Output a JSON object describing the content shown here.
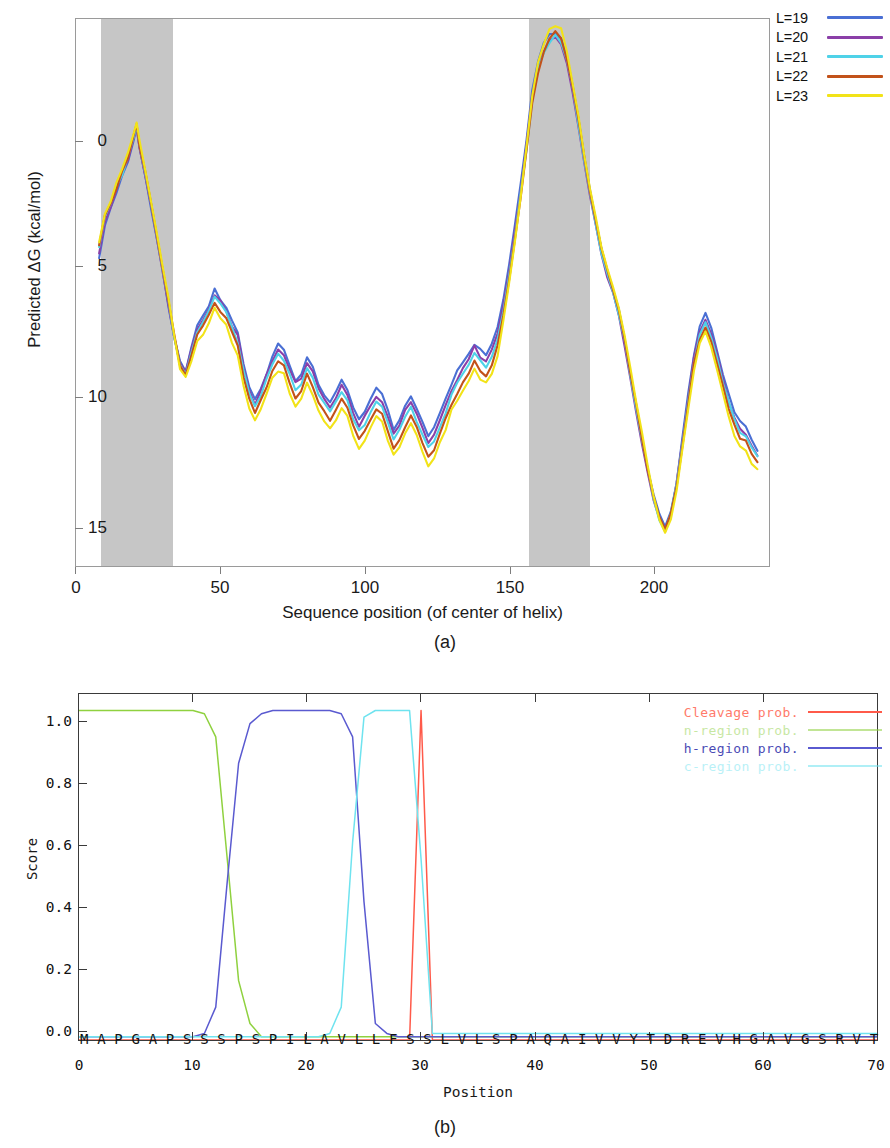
{
  "panel_a": {
    "caption": "(a)",
    "xlabel": "Sequence position (of center of helix)",
    "ylabel": "Predicted ΔG (kcal/mol)",
    "xticks": [
      "0",
      "50",
      "100",
      "150",
      "200"
    ],
    "yticks": [
      "0",
      "5",
      "10",
      "15"
    ],
    "legend": [
      {
        "label": "L=19",
        "color": "#4a6fd4"
      },
      {
        "label": "L=20",
        "color": "#8b3fa8"
      },
      {
        "label": "L=21",
        "color": "#4fd2e8"
      },
      {
        "label": "L=22",
        "color": "#c2521a"
      },
      {
        "label": "L=23",
        "color": "#f2e318"
      }
    ],
    "shaded_regions": [
      {
        "start": 9,
        "end": 34,
        "color": "#c3c3c3"
      },
      {
        "start": 157,
        "end": 178,
        "color": "#c3c3c3"
      }
    ]
  },
  "panel_b": {
    "caption": "(b)",
    "xlabel": "Position",
    "ylabel": "Score",
    "xticks": [
      "0",
      "10",
      "20",
      "30",
      "40",
      "50",
      "60",
      "70"
    ],
    "yticks": [
      "0.0",
      "0.2",
      "0.4",
      "0.6",
      "0.8",
      "1.0"
    ],
    "sequence": "M A P G A P S S S P S P I L A V L L F S S L V L S P A Q A I V V Y T D R E V H G A V G S R V T L H C S F W S S E W V S D D I S F T W R Y Q P",
    "legend": [
      {
        "label": "Cleavage prob.",
        "color": "#ff5a4a"
      },
      {
        "label": "n-region prob.",
        "color": "#8fd13f"
      },
      {
        "label": "h-region prob.",
        "color": "#5a5ad0"
      },
      {
        "label": "c-region prob.",
        "color": "#6fe3ef"
      }
    ]
  },
  "chart_data": [
    {
      "type": "line",
      "panel": "(a)",
      "title": "",
      "xlabel": "Sequence position (of center of helix)",
      "ylabel": "Predicted ΔG (kcal/mol)",
      "xlim": [
        0,
        240
      ],
      "ylim": [
        -3.0,
        16.5
      ],
      "y_axis_inverted": true,
      "grid": false,
      "legend_position": "top-right-outside",
      "shaded_regions": [
        [
          9,
          34
        ],
        [
          157,
          178
        ]
      ],
      "x": [
        8,
        10,
        12,
        14,
        16,
        18,
        20,
        21,
        22,
        24,
        26,
        28,
        30,
        32,
        34,
        36,
        38,
        40,
        42,
        44,
        46,
        48,
        50,
        52,
        54,
        56,
        58,
        60,
        62,
        64,
        66,
        68,
        70,
        72,
        74,
        76,
        78,
        80,
        82,
        84,
        86,
        88,
        90,
        92,
        94,
        96,
        98,
        100,
        102,
        104,
        106,
        108,
        110,
        112,
        114,
        116,
        118,
        120,
        122,
        124,
        126,
        128,
        130,
        132,
        134,
        136,
        138,
        140,
        142,
        144,
        146,
        148,
        150,
        152,
        154,
        156,
        158,
        160,
        162,
        164,
        166,
        168,
        170,
        172,
        174,
        176,
        178,
        180,
        182,
        184,
        186,
        188,
        190,
        192,
        194,
        196,
        198,
        200,
        202,
        204,
        206,
        208,
        210,
        212,
        214,
        216,
        218,
        220,
        222,
        224,
        226,
        228,
        230,
        232,
        234,
        236,
        237
      ],
      "series": [
        {
          "name": "L=19",
          "color": "#4a6fd4",
          "values": [
            5.6,
            4.3,
            3.8,
            3.2,
            2.6,
            2.1,
            1.3,
            0.9,
            1.6,
            2.6,
            3.7,
            4.8,
            6.0,
            7.2,
            8.3,
            9.2,
            9.5,
            8.7,
            7.9,
            7.6,
            7.2,
            6.6,
            7.0,
            7.3,
            7.8,
            8.2,
            9.3,
            10.2,
            10.6,
            10.2,
            9.6,
            9.0,
            8.6,
            8.8,
            9.4,
            9.9,
            9.6,
            9.0,
            9.4,
            10.0,
            10.4,
            10.6,
            10.3,
            9.9,
            10.2,
            10.8,
            11.3,
            11.0,
            10.6,
            10.2,
            10.4,
            11.0,
            11.6,
            11.3,
            10.8,
            10.4,
            10.9,
            11.4,
            11.9,
            11.6,
            11.1,
            10.6,
            10.0,
            9.6,
            9.3,
            9.0,
            8.6,
            8.8,
            9.0,
            8.6,
            8.0,
            7.0,
            5.8,
            4.4,
            2.9,
            1.3,
            -0.4,
            -1.5,
            -2.1,
            -2.4,
            -2.5,
            -2.3,
            -1.6,
            -0.6,
            0.6,
            1.9,
            3.1,
            4.2,
            5.2,
            6.0,
            6.6,
            7.4,
            8.4,
            9.6,
            10.8,
            11.9,
            13.0,
            14.0,
            14.7,
            15.1,
            14.6,
            13.5,
            12.0,
            10.4,
            9.0,
            7.9,
            7.5,
            8.0,
            8.8,
            9.6,
            10.4,
            11.0,
            11.4,
            11.6,
            12.0,
            12.4
          ]
        },
        {
          "name": "L=20",
          "color": "#8b3fa8",
          "values": [
            5.4,
            4.2,
            3.7,
            3.1,
            2.5,
            2.0,
            1.2,
            0.9,
            1.6,
            2.6,
            3.7,
            4.8,
            6.0,
            7.2,
            8.3,
            9.3,
            9.6,
            8.8,
            8.0,
            7.7,
            7.3,
            6.8,
            7.1,
            7.4,
            7.9,
            8.3,
            9.4,
            10.3,
            10.7,
            10.3,
            9.7,
            9.2,
            8.8,
            9.0,
            9.5,
            10.0,
            9.8,
            9.2,
            9.6,
            10.2,
            10.5,
            10.8,
            10.5,
            10.1,
            10.4,
            11.0,
            11.5,
            11.2,
            10.8,
            10.4,
            10.6,
            11.2,
            11.8,
            11.5,
            11.0,
            10.6,
            11.1,
            11.6,
            12.1,
            11.8,
            11.3,
            10.8,
            10.2,
            9.8,
            9.5,
            9.1,
            8.7,
            9.0,
            9.2,
            8.8,
            8.2,
            7.2,
            6.0,
            4.6,
            3.1,
            1.5,
            -0.2,
            -1.3,
            -1.9,
            -2.2,
            -2.3,
            -2.1,
            -1.4,
            -0.4,
            0.8,
            2.1,
            3.3,
            4.4,
            5.4,
            6.2,
            6.8,
            7.6,
            8.6,
            9.8,
            11.0,
            12.1,
            13.2,
            14.1,
            14.8,
            15.2,
            14.7,
            13.6,
            12.1,
            10.5,
            9.1,
            8.1,
            7.7,
            8.2,
            9.0,
            9.8,
            10.6,
            11.2,
            11.6,
            11.8,
            12.2,
            12.5
          ]
        },
        {
          "name": "L=21",
          "color": "#4fd2e8",
          "values": [
            5.2,
            4.1,
            3.6,
            3.0,
            2.5,
            1.9,
            1.2,
            0.8,
            1.5,
            2.5,
            3.6,
            4.7,
            5.9,
            7.1,
            8.3,
            9.3,
            9.6,
            8.9,
            8.1,
            7.8,
            7.4,
            6.9,
            7.2,
            7.5,
            8.0,
            8.5,
            9.5,
            10.4,
            10.8,
            10.4,
            9.9,
            9.3,
            9.0,
            9.2,
            9.7,
            10.2,
            10.0,
            9.4,
            9.8,
            10.4,
            10.7,
            11.0,
            10.7,
            10.3,
            10.6,
            11.2,
            11.7,
            11.4,
            11.0,
            10.6,
            10.8,
            11.4,
            12.0,
            11.7,
            11.2,
            10.8,
            11.3,
            11.8,
            12.3,
            12.0,
            11.5,
            11.0,
            10.4,
            10.0,
            9.6,
            9.3,
            8.9,
            9.2,
            9.4,
            9.0,
            8.4,
            7.4,
            6.1,
            4.7,
            3.2,
            1.6,
            -0.1,
            -1.2,
            -1.8,
            -2.2,
            -2.4,
            -2.2,
            -1.5,
            -0.5,
            0.7,
            2.0,
            3.2,
            4.3,
            5.3,
            6.1,
            6.7,
            7.5,
            8.5,
            9.7,
            10.9,
            12.0,
            13.1,
            14.1,
            14.8,
            15.2,
            14.7,
            13.6,
            12.2,
            10.6,
            9.2,
            8.2,
            7.8,
            8.3,
            9.1,
            9.9,
            10.7,
            11.3,
            11.7,
            11.9,
            12.3,
            12.6
          ]
        },
        {
          "name": "L=22",
          "color": "#c2521a",
          "values": [
            5.1,
            4.0,
            3.6,
            3.0,
            2.4,
            1.9,
            1.1,
            0.8,
            1.5,
            2.5,
            3.6,
            4.7,
            5.9,
            7.1,
            8.3,
            9.4,
            9.7,
            9.0,
            8.3,
            8.0,
            7.6,
            7.1,
            7.4,
            7.7,
            8.2,
            8.7,
            9.7,
            10.6,
            11.0,
            10.6,
            10.1,
            9.5,
            9.2,
            9.4,
            10.0,
            10.5,
            10.2,
            9.7,
            10.1,
            10.7,
            11.0,
            11.3,
            11.0,
            10.6,
            10.9,
            11.5,
            12.0,
            11.7,
            11.3,
            10.9,
            11.1,
            11.7,
            12.3,
            12.0,
            11.5,
            11.1,
            11.6,
            12.1,
            12.6,
            12.3,
            11.8,
            11.3,
            10.7,
            10.3,
            9.9,
            9.6,
            9.2,
            9.5,
            9.7,
            9.3,
            8.7,
            7.6,
            6.3,
            4.8,
            3.3,
            1.7,
            0.0,
            -1.1,
            -1.8,
            -2.3,
            -2.5,
            -2.3,
            -1.6,
            -0.6,
            0.6,
            1.9,
            3.1,
            4.2,
            5.2,
            6.0,
            6.6,
            7.4,
            8.4,
            9.6,
            10.8,
            11.9,
            13.0,
            14.0,
            14.8,
            15.2,
            14.7,
            13.7,
            12.3,
            10.7,
            9.3,
            8.4,
            8.0,
            8.5,
            9.3,
            10.1,
            10.9,
            11.5,
            11.9,
            12.1,
            12.5,
            12.8
          ]
        },
        {
          "name": "L=23",
          "color": "#f2e318",
          "values": [
            5.0,
            3.9,
            3.5,
            2.9,
            2.4,
            1.8,
            1.0,
            0.7,
            1.4,
            2.4,
            3.5,
            4.6,
            5.8,
            7.0,
            8.3,
            9.5,
            9.8,
            9.2,
            8.5,
            8.2,
            7.8,
            7.3,
            7.6,
            7.9,
            8.5,
            9.0,
            10.0,
            10.9,
            11.3,
            10.9,
            10.4,
            9.8,
            9.5,
            9.7,
            10.3,
            10.8,
            10.5,
            10.0,
            10.4,
            11.0,
            11.3,
            11.6,
            11.3,
            10.9,
            11.2,
            11.8,
            12.3,
            12.0,
            11.6,
            11.2,
            11.4,
            12.0,
            12.6,
            12.3,
            11.8,
            11.4,
            11.9,
            12.4,
            12.9,
            12.6,
            12.1,
            11.6,
            11.0,
            10.6,
            10.2,
            9.9,
            9.5,
            9.8,
            10.0,
            9.6,
            9.0,
            7.8,
            6.4,
            4.9,
            3.3,
            1.6,
            -0.2,
            -1.4,
            -2.1,
            -2.6,
            -2.8,
            -2.6,
            -1.8,
            -0.7,
            0.5,
            1.8,
            3.0,
            4.1,
            5.1,
            5.9,
            6.5,
            7.3,
            8.3,
            9.5,
            10.7,
            11.8,
            12.9,
            14.0,
            14.9,
            15.3,
            14.8,
            13.8,
            12.4,
            10.9,
            9.5,
            8.6,
            8.2,
            8.7,
            9.5,
            10.3,
            11.1,
            11.8,
            12.2,
            12.4,
            12.8,
            13.1
          ]
        }
      ]
    },
    {
      "type": "line",
      "panel": "(b)",
      "title": "",
      "xlabel": "Position",
      "ylabel": "Score",
      "xlim": [
        0,
        70
      ],
      "ylim": [
        0.0,
        1.05
      ],
      "grid": false,
      "legend_position": "top-right-inside",
      "x": [
        0,
        1,
        2,
        3,
        4,
        5,
        6,
        7,
        8,
        9,
        10,
        11,
        12,
        13,
        14,
        15,
        16,
        17,
        18,
        19,
        20,
        21,
        22,
        23,
        24,
        25,
        26,
        27,
        28,
        29,
        30,
        31,
        32,
        33,
        34,
        35,
        40,
        45,
        50,
        55,
        60,
        65,
        70
      ],
      "series": [
        {
          "name": "Cleavage prob.",
          "color": "#ff5a4a",
          "values": [
            0.0,
            0.0,
            0.0,
            0.0,
            0.0,
            0.0,
            0.0,
            0.0,
            0.0,
            0.0,
            0.0,
            0.0,
            0.0,
            0.0,
            0.0,
            0.0,
            0.0,
            0.0,
            0.0,
            0.0,
            0.0,
            0.0,
            0.0,
            0.0,
            0.0,
            0.0,
            0.0,
            0.0,
            0.0,
            0.0,
            1.0,
            0.0,
            0.0,
            0.0,
            0.0,
            0.0,
            0.0,
            0.0,
            0.0,
            0.0,
            0.0,
            0.0,
            0.0
          ]
        },
        {
          "name": "n-region prob.",
          "color": "#8fd13f",
          "values": [
            1.0,
            1.0,
            1.0,
            1.0,
            1.0,
            1.0,
            1.0,
            1.0,
            1.0,
            1.0,
            1.0,
            0.99,
            0.92,
            0.55,
            0.18,
            0.05,
            0.01,
            0.01,
            0.01,
            0.01,
            0.01,
            0.01,
            0.01,
            0.01,
            0.01,
            0.01,
            0.01,
            0.01,
            0.01,
            0.01,
            0.01,
            0.01,
            0.01,
            0.01,
            0.01,
            0.01,
            0.01,
            0.01,
            0.01,
            0.01,
            0.01,
            0.01,
            0.01
          ]
        },
        {
          "name": "h-region prob.",
          "color": "#5a5ad0",
          "values": [
            0.01,
            0.01,
            0.01,
            0.01,
            0.01,
            0.01,
            0.01,
            0.01,
            0.01,
            0.01,
            0.01,
            0.02,
            0.1,
            0.48,
            0.84,
            0.96,
            0.99,
            1.0,
            1.0,
            1.0,
            1.0,
            1.0,
            1.0,
            0.99,
            0.92,
            0.42,
            0.05,
            0.02,
            0.01,
            0.01,
            0.01,
            0.01,
            0.01,
            0.01,
            0.01,
            0.01,
            0.01,
            0.01,
            0.01,
            0.01,
            0.01,
            0.01,
            0.01
          ]
        },
        {
          "name": "c-region prob.",
          "color": "#6fe3ef",
          "values": [
            0.01,
            0.01,
            0.01,
            0.01,
            0.01,
            0.01,
            0.01,
            0.01,
            0.01,
            0.01,
            0.01,
            0.01,
            0.01,
            0.01,
            0.01,
            0.01,
            0.01,
            0.01,
            0.01,
            0.01,
            0.01,
            0.01,
            0.02,
            0.1,
            0.6,
            0.98,
            1.0,
            1.0,
            1.0,
            1.0,
            0.55,
            0.02,
            0.02,
            0.02,
            0.02,
            0.02,
            0.02,
            0.02,
            0.02,
            0.02,
            0.02,
            0.02,
            0.02
          ]
        }
      ]
    }
  ]
}
